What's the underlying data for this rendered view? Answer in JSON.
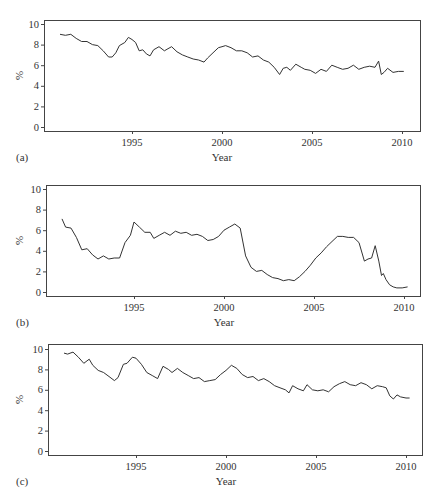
{
  "chart_data": [
    {
      "panel": "(a)",
      "type": "line",
      "title": "",
      "xlabel": "Year",
      "ylabel": "%",
      "xlim": [
        1990.2,
        2011.0
      ],
      "ylim": [
        -0.3,
        10.3
      ],
      "xticks": [
        1995,
        2000,
        2005,
        2010
      ],
      "yticks": [
        0,
        2,
        4,
        6,
        8,
        10
      ],
      "grid": false,
      "legend": null,
      "series": [
        {
          "name": "a",
          "x": [
            1991.0,
            1991.3,
            1991.6,
            1991.9,
            1992.2,
            1992.5,
            1992.8,
            1993.1,
            1993.4,
            1993.7,
            1993.9,
            1994.1,
            1994.3,
            1994.6,
            1994.8,
            1995.0,
            1995.2,
            1995.4,
            1995.6,
            1995.8,
            1996.0,
            1996.2,
            1996.5,
            1996.8,
            1997.0,
            1997.2,
            1997.5,
            1997.8,
            1998.1,
            1998.4,
            1998.7,
            1999.0,
            1999.2,
            1999.5,
            1999.8,
            2000.0,
            2000.2,
            2000.5,
            2000.8,
            2001.1,
            2001.4,
            2001.7,
            2002.0,
            2002.3,
            2002.6,
            2002.9,
            2003.2,
            2003.4,
            2003.6,
            2003.8,
            2004.1,
            2004.4,
            2004.6,
            2004.9,
            2005.2,
            2005.5,
            2005.8,
            2006.1,
            2006.4,
            2006.7,
            2007.0,
            2007.3,
            2007.6,
            2007.9,
            2008.2,
            2008.5,
            2008.7,
            2008.85,
            2009.0,
            2009.2,
            2009.5,
            2009.8,
            2010.1
          ],
          "y": [
            9.0,
            8.9,
            9.0,
            8.6,
            8.3,
            8.3,
            8.0,
            7.9,
            7.4,
            6.8,
            6.8,
            7.2,
            7.9,
            8.2,
            8.7,
            8.5,
            8.2,
            7.4,
            7.5,
            7.1,
            6.9,
            7.5,
            7.8,
            7.4,
            7.6,
            7.8,
            7.3,
            7.0,
            6.8,
            6.6,
            6.5,
            6.3,
            6.7,
            7.2,
            7.7,
            7.8,
            7.9,
            7.7,
            7.4,
            7.4,
            7.2,
            6.8,
            6.9,
            6.5,
            6.3,
            5.8,
            5.1,
            5.7,
            5.8,
            5.5,
            6.1,
            5.8,
            5.6,
            5.5,
            5.2,
            5.6,
            5.4,
            6.0,
            5.8,
            5.6,
            5.7,
            6.0,
            5.6,
            5.8,
            5.9,
            5.8,
            6.4,
            5.1,
            5.3,
            5.7,
            5.3,
            5.4,
            5.4
          ]
        }
      ]
    },
    {
      "panel": "(b)",
      "type": "line",
      "title": "",
      "xlabel": "Year",
      "ylabel": "%",
      "xlim": [
        1990.2,
        2011.0
      ],
      "ylim": [
        -0.3,
        10.3
      ],
      "xticks": [
        1995,
        2000,
        2005,
        2010
      ],
      "yticks": [
        0,
        2,
        4,
        6,
        8,
        10
      ],
      "grid": false,
      "legend": null,
      "series": [
        {
          "name": "b",
          "x": [
            1991.0,
            1991.2,
            1991.5,
            1991.8,
            1992.1,
            1992.4,
            1992.7,
            1993.0,
            1993.3,
            1993.6,
            1993.9,
            1994.2,
            1994.5,
            1994.8,
            1995.0,
            1995.3,
            1995.6,
            1995.9,
            1996.1,
            1996.4,
            1996.7,
            1997.0,
            1997.3,
            1997.6,
            1997.9,
            1998.2,
            1998.5,
            1998.8,
            1999.1,
            1999.4,
            1999.7,
            2000.0,
            2000.3,
            2000.6,
            2000.9,
            2001.2,
            2001.5,
            2001.8,
            2002.1,
            2002.4,
            2002.7,
            2003.0,
            2003.3,
            2003.6,
            2003.9,
            2004.2,
            2004.5,
            2004.8,
            2005.1,
            2005.4,
            2005.7,
            2006.0,
            2006.3,
            2006.6,
            2006.9,
            2007.2,
            2007.5,
            2007.8,
            2008.0,
            2008.2,
            2008.4,
            2008.6,
            2008.75,
            2008.85,
            2009.0,
            2009.2,
            2009.4,
            2009.6,
            2009.9,
            2010.2
          ],
          "y": [
            7.1,
            6.3,
            6.2,
            5.3,
            4.1,
            4.2,
            3.6,
            3.2,
            3.5,
            3.2,
            3.3,
            3.3,
            4.8,
            5.5,
            6.8,
            6.3,
            5.8,
            5.8,
            5.2,
            5.5,
            5.8,
            5.5,
            5.9,
            5.7,
            5.8,
            5.5,
            5.6,
            5.4,
            5.0,
            5.1,
            5.4,
            6.0,
            6.3,
            6.6,
            6.2,
            3.5,
            2.4,
            2.0,
            2.1,
            1.7,
            1.4,
            1.3,
            1.1,
            1.2,
            1.1,
            1.5,
            2.0,
            2.6,
            3.3,
            3.8,
            4.4,
            4.9,
            5.4,
            5.4,
            5.3,
            5.3,
            4.8,
            3.0,
            3.2,
            3.3,
            4.5,
            3.0,
            1.6,
            1.8,
            1.2,
            0.7,
            0.5,
            0.4,
            0.4,
            0.5
          ]
        }
      ]
    },
    {
      "panel": "(c)",
      "type": "line",
      "title": "",
      "xlabel": "Year",
      "ylabel": "%",
      "xlim": [
        1990.2,
        2011.0
      ],
      "ylim": [
        -0.3,
        10.3
      ],
      "xticks": [
        1995,
        2000,
        2005,
        2010
      ],
      "yticks": [
        0,
        2,
        4,
        6,
        8,
        10
      ],
      "grid": false,
      "legend": null,
      "series": [
        {
          "name": "c",
          "x": [
            1991.0,
            1991.2,
            1991.5,
            1991.8,
            1992.1,
            1992.4,
            1992.6,
            1992.9,
            1993.2,
            1993.5,
            1993.8,
            1994.0,
            1994.3,
            1994.5,
            1994.8,
            1995.0,
            1995.3,
            1995.6,
            1995.9,
            1996.2,
            1996.5,
            1996.8,
            1997.0,
            1997.3,
            1997.6,
            1997.9,
            1998.2,
            1998.5,
            1998.8,
            1999.1,
            1999.4,
            1999.7,
            2000.0,
            2000.3,
            2000.6,
            2000.9,
            2001.2,
            2001.5,
            2001.8,
            2002.1,
            2002.4,
            2002.7,
            2003.0,
            2003.3,
            2003.5,
            2003.7,
            2004.0,
            2004.3,
            2004.5,
            2004.8,
            2005.1,
            2005.4,
            2005.7,
            2006.0,
            2006.3,
            2006.6,
            2006.9,
            2007.2,
            2007.5,
            2007.8,
            2008.1,
            2008.4,
            2008.7,
            2008.9,
            2009.1,
            2009.3,
            2009.5,
            2009.7,
            2010.0,
            2010.2
          ],
          "y": [
            9.6,
            9.5,
            9.7,
            9.2,
            8.6,
            9.0,
            8.4,
            7.9,
            7.7,
            7.3,
            6.9,
            7.2,
            8.5,
            8.6,
            9.2,
            9.1,
            8.5,
            7.7,
            7.4,
            7.1,
            8.3,
            8.0,
            7.7,
            8.1,
            7.7,
            7.4,
            7.1,
            7.2,
            6.8,
            6.9,
            7.0,
            7.5,
            7.9,
            8.4,
            8.1,
            7.5,
            7.2,
            7.3,
            6.9,
            7.1,
            6.8,
            6.4,
            6.2,
            6.0,
            5.7,
            6.4,
            6.1,
            5.9,
            6.5,
            6.0,
            5.9,
            6.0,
            5.8,
            6.3,
            6.6,
            6.8,
            6.5,
            6.4,
            6.7,
            6.5,
            6.1,
            6.4,
            6.3,
            6.2,
            5.4,
            5.1,
            5.5,
            5.3,
            5.2,
            5.2
          ]
        }
      ]
    }
  ],
  "panels": [
    {
      "label": "(a)",
      "xlabel": "Year",
      "ylabel": "%"
    },
    {
      "label": "(b)",
      "xlabel": "Year",
      "ylabel": "%"
    },
    {
      "label": "(c)",
      "xlabel": "Year",
      "ylabel": "%"
    }
  ]
}
